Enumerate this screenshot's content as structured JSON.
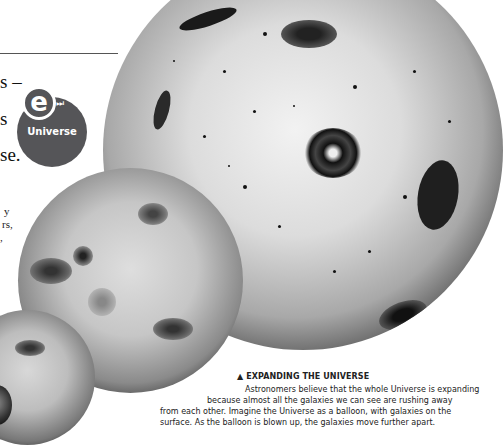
{
  "left_text": {
    "fragment_1": "s –",
    "fragment_2": "s",
    "fragment_3": "se.",
    "fragment_4": "y",
    "fragment_5": "rs,",
    "fragment_6": ","
  },
  "e_link_badge": {
    "letter": "e",
    "forward_glyph": "⏭",
    "label": "Universe",
    "color": "#555558"
  },
  "caption": {
    "marker": "▲",
    "title": "EXPANDING THE UNIVERSE",
    "lines": [
      "Astronomers believe that the whole Universe is expanding",
      "because almost all the galaxies we can see are rushing away",
      "from each other. Imagine the Universe as a balloon, with galaxies on the",
      "surface. As the balloon is blown up, the galaxies move further apart."
    ]
  },
  "illustration": {
    "description": "Balloons of increasing size dotted with galaxies and stars",
    "icon": "galaxy-balloon-illustration"
  }
}
